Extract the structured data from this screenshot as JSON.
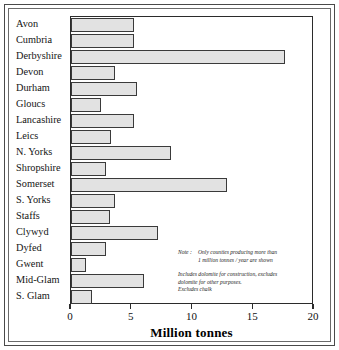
{
  "chart_data": {
    "type": "bar",
    "orientation": "horizontal",
    "title": "",
    "xlabel": "Million tonnes",
    "ylabel": "",
    "xlim": [
      0,
      20
    ],
    "ylim": null,
    "grid": false,
    "legend": null,
    "xticks": [
      "0",
      "5",
      "10",
      "15",
      "20"
    ],
    "xtick_values": [
      0,
      5,
      10,
      15,
      20
    ],
    "categories": [
      "Avon",
      "Cumbria",
      "Derbyshire",
      "Devon",
      "Durham",
      "Gloucs",
      "Lancashire",
      "Leics",
      "N. Yorks",
      "Shropshire",
      "Somerset",
      "S. Yorks",
      "Staffs",
      "Clywyd",
      "Dyfed",
      "Gwent",
      "Mid-Glam",
      "S. Glam"
    ],
    "values": [
      5.2,
      5.2,
      17.6,
      3.6,
      5.4,
      2.5,
      5.2,
      3.3,
      8.2,
      2.9,
      12.8,
      3.6,
      3.2,
      7.2,
      2.9,
      1.2,
      6.0,
      1.7
    ],
    "bar_fill_color": "#e2e2e2",
    "bar_edge_color": "#3a3a3a",
    "annotations": [
      "Note :   Only counties producing more than 1 million tonnes / year are shown",
      "Includes dolomite for construction, excludes dolomite for other purposes.",
      "Excludes chalk"
    ]
  },
  "notes": {
    "note_key": "Note :",
    "note_line1": "Only counties producing more than",
    "note_line2": "1 million tonnes / year are shown",
    "para_line1": "Includes dolomite for construction, excludes",
    "para_line2": "dolomite for other purposes.",
    "para_line3": "Excludes chalk"
  }
}
